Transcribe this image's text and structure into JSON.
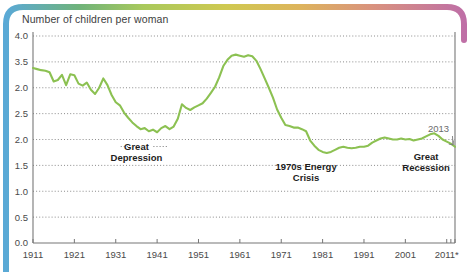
{
  "chart_data": {
    "type": "line",
    "title": "Number of children per woman",
    "xlabel": "",
    "ylabel": "",
    "ylim": [
      0.0,
      4.0
    ],
    "xlim": [
      1911,
      2013
    ],
    "grid": "horizontal-dotted",
    "legend": "none",
    "series_color": "#8cc152",
    "y_ticks": [
      "4.0",
      "3.5",
      "2.0",
      "2.5",
      "2.0",
      "1.5",
      "1.0",
      "0.5",
      "0.0"
    ],
    "y_tick_values": [
      4.0,
      3.5,
      3.0,
      2.5,
      2.0,
      1.5,
      1.0,
      0.5,
      0.0
    ],
    "x_ticks": [
      "1911",
      "1921",
      "1931",
      "1941",
      "1951",
      "1961",
      "1971",
      "1981",
      "1991",
      "2001",
      "2011*"
    ],
    "x_tick_values": [
      1911,
      1921,
      1931,
      1941,
      1951,
      1961,
      1971,
      1981,
      1991,
      2001,
      2011
    ],
    "series": [
      {
        "name": "Total fertility rate",
        "x": [
          1911,
          1912,
          1913,
          1914,
          1915,
          1916,
          1917,
          1918,
          1919,
          1920,
          1921,
          1922,
          1923,
          1924,
          1925,
          1926,
          1927,
          1928,
          1929,
          1930,
          1931,
          1932,
          1933,
          1934,
          1935,
          1936,
          1937,
          1938,
          1939,
          1940,
          1941,
          1942,
          1943,
          1944,
          1945,
          1946,
          1947,
          1948,
          1949,
          1950,
          1951,
          1952,
          1953,
          1954,
          1955,
          1956,
          1957,
          1958,
          1959,
          1960,
          1961,
          1962,
          1963,
          1964,
          1965,
          1966,
          1967,
          1968,
          1969,
          1970,
          1971,
          1972,
          1973,
          1974,
          1975,
          1976,
          1977,
          1978,
          1979,
          1980,
          1981,
          1982,
          1983,
          1984,
          1985,
          1986,
          1987,
          1988,
          1989,
          1990,
          1991,
          1992,
          1993,
          1994,
          1995,
          1996,
          1997,
          1998,
          1999,
          2000,
          2001,
          2002,
          2003,
          2004,
          2005,
          2006,
          2007,
          2008,
          2009,
          2010,
          2011,
          2012,
          2013
        ],
        "y": [
          3.38,
          3.36,
          3.34,
          3.33,
          3.3,
          3.12,
          3.15,
          3.25,
          3.05,
          3.26,
          3.24,
          3.08,
          3.04,
          3.1,
          2.96,
          2.88,
          3.0,
          3.18,
          3.05,
          2.86,
          2.72,
          2.66,
          2.52,
          2.42,
          2.33,
          2.26,
          2.2,
          2.22,
          2.16,
          2.19,
          2.14,
          2.22,
          2.26,
          2.2,
          2.25,
          2.4,
          2.68,
          2.61,
          2.57,
          2.62,
          2.66,
          2.7,
          2.79,
          2.9,
          3.02,
          3.2,
          3.42,
          3.54,
          3.62,
          3.64,
          3.62,
          3.6,
          3.63,
          3.61,
          3.52,
          3.36,
          3.18,
          3.0,
          2.81,
          2.58,
          2.42,
          2.28,
          2.26,
          2.23,
          2.23,
          2.2,
          2.16,
          1.98,
          1.88,
          1.8,
          1.76,
          1.74,
          1.76,
          1.8,
          1.84,
          1.86,
          1.84,
          1.83,
          1.84,
          1.86,
          1.86,
          1.88,
          1.94,
          1.98,
          2.02,
          2.04,
          2.02,
          2.0,
          2.0,
          2.02,
          2.0,
          2.01,
          1.98,
          2.0,
          2.02,
          2.06,
          2.1,
          2.12,
          2.07,
          2.0,
          1.96,
          1.92,
          1.86
        ]
      }
    ],
    "annotations": [
      {
        "name": "great-depression",
        "text_line1": "Great",
        "text_line2": "Depression",
        "x": 1936,
        "style": "bold"
      },
      {
        "name": "energy-crisis",
        "text_line1": "1970s Energy",
        "text_line2": "Crisis",
        "x": 1977,
        "style": "bold"
      },
      {
        "name": "great-recession",
        "text_line1": "Great",
        "text_line2": "Recession",
        "x": 2006,
        "style": "bold"
      },
      {
        "name": "end-year-callout",
        "text_line1": "2013",
        "text_line2": "",
        "x": 2009,
        "style": "plain"
      }
    ]
  },
  "decor": {
    "gradient_stops": [
      "#5aa9d6",
      "#7cb96a",
      "#b9cf55",
      "#d8c84f",
      "#e0a862",
      "#d48f86",
      "#bf6fa6"
    ],
    "left_bar_color": "#5aa9d6",
    "right_arc_color": "#bf6fa6"
  }
}
